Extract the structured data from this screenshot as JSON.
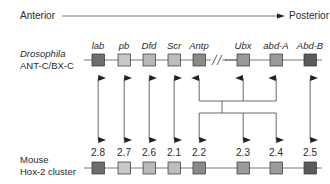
{
  "axis": {
    "left_label": "Anterior",
    "right_label": "Posterior"
  },
  "drosophila": {
    "label_line1": "Drosophila",
    "label_line2": "ANT-C/BX-C",
    "genes": [
      {
        "name": "lab",
        "x": 98,
        "fill": "#6e6e6e"
      },
      {
        "name": "pb",
        "x": 124,
        "fill": "#c8c8c8"
      },
      {
        "name": "Dfd",
        "x": 149,
        "fill": "#b9b9b9"
      },
      {
        "name": "Scr",
        "x": 174,
        "fill": "#bdbdbd"
      },
      {
        "name": "Antp",
        "x": 199,
        "fill": "#8a8a8a"
      },
      {
        "name": "Ubx",
        "x": 243,
        "fill": "#9a9a9a"
      },
      {
        "name": "abd-A",
        "x": 276,
        "fill": "#9a9a9a"
      },
      {
        "name": "Abd-B",
        "x": 310,
        "fill": "#5a5a5a"
      }
    ],
    "break_symbol": "//"
  },
  "mouse": {
    "label_line1": "Mouse",
    "label_line2": "Hox-2 cluster",
    "genes": [
      {
        "name": "2.8",
        "x": 98,
        "fill": "#6e6e6e"
      },
      {
        "name": "2.7",
        "x": 124,
        "fill": "#c8c8c8"
      },
      {
        "name": "2.6",
        "x": 149,
        "fill": "#b9b9b9"
      },
      {
        "name": "2.1",
        "x": 174,
        "fill": "#bdbdbd"
      },
      {
        "name": "2.2",
        "x": 199,
        "fill": "#8a8a8a"
      },
      {
        "name": "2.3",
        "x": 243,
        "fill": "#9a9a9a"
      },
      {
        "name": "2.4",
        "x": 276,
        "fill": "#9a9a9a"
      },
      {
        "name": "2.5",
        "x": 310,
        "fill": "#5a5a5a"
      }
    ]
  },
  "homology": {
    "direct_pairs": [
      [
        "lab",
        "2.8"
      ],
      [
        "pb",
        "2.7"
      ],
      [
        "Dfd",
        "2.6"
      ],
      [
        "Scr",
        "2.1"
      ],
      [
        "Abd-B",
        "2.5"
      ]
    ],
    "grouped": {
      "drosophila": [
        "Antp",
        "Ubx",
        "abd-A"
      ],
      "mouse": [
        "2.2",
        "2.3",
        "2.4"
      ]
    }
  },
  "colors": {
    "line": "#555555",
    "box_stroke": "#333333",
    "text": "#2a2a2a"
  }
}
